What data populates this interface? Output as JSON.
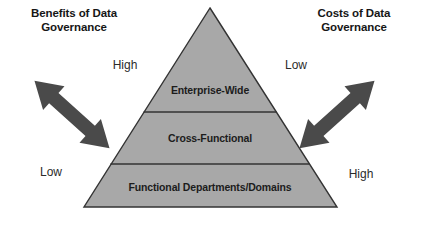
{
  "headings": {
    "left": "Benefits of Data Governance",
    "right": "Costs of Data Governance"
  },
  "scale_labels": {
    "left_top": "High",
    "left_bottom": "Low",
    "right_top": "Low",
    "right_bottom": "High"
  },
  "pyramid": {
    "tiers": [
      {
        "label": "Enterprise-Wide"
      },
      {
        "label": "Cross-Functional"
      },
      {
        "label": "Functional Departments/Domains"
      }
    ],
    "fill_color": "#a8a8a8",
    "outline_color": "#333333"
  },
  "arrows": {
    "color": "#4a4a4a",
    "left_name": "benefits-double-arrow",
    "right_name": "costs-double-arrow"
  }
}
